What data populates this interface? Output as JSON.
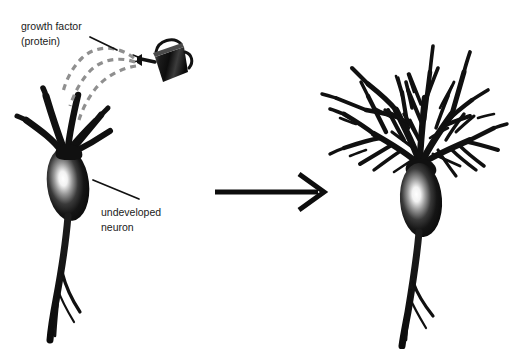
{
  "figure": {
    "background_color": "#ffffff",
    "width": 514,
    "height": 349
  },
  "labels": {
    "growth_factor_line1": "growth factor",
    "growth_factor_line2": "(protein)",
    "undeveloped_line1": "undeveloped",
    "undeveloped_line2": "neuron"
  },
  "colors": {
    "ink": "#111111",
    "text": "#1a1a1a",
    "spray": "#8c8c8c",
    "soma_highlight": "#ffffff",
    "leader_line": "#111111"
  },
  "icons": {
    "watering_can": "watering-can-icon",
    "transform_arrow": "right-arrow-icon",
    "spray": "dashed-spray-icon"
  },
  "elements": {
    "left_neuron_name": "undeveloped-neuron",
    "right_neuron_name": "developed-neuron",
    "arrow_direction": "right"
  }
}
